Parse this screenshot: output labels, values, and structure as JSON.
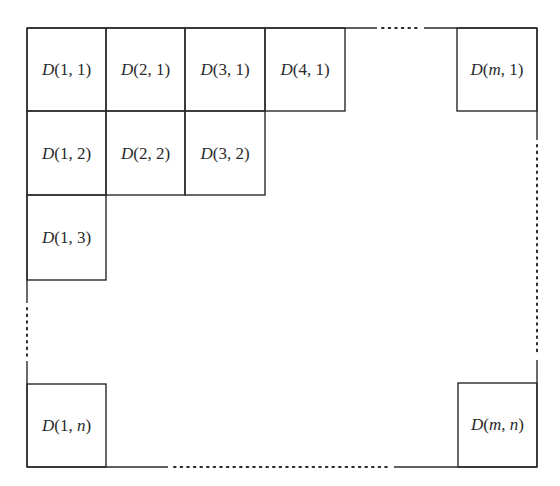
{
  "diagram": {
    "title": "",
    "cells": [
      {
        "id": "D11",
        "prefix": "D",
        "args": "(1, 1)",
        "a": "1",
        "b": "1",
        "col": 1,
        "row": 1
      },
      {
        "id": "D21",
        "prefix": "D",
        "args": "(2, 1)",
        "a": "2",
        "b": "1",
        "col": 2,
        "row": 1
      },
      {
        "id": "D31",
        "prefix": "D",
        "args": "(3, 1)",
        "a": "3",
        "b": "1",
        "col": 3,
        "row": 1
      },
      {
        "id": "D41",
        "prefix": "D",
        "args": "(4, 1)",
        "a": "4",
        "b": "1",
        "col": 4,
        "row": 1
      },
      {
        "id": "Dm1",
        "prefix": "D",
        "args": "(m, 1)",
        "a": "m",
        "b": "1",
        "col": "m",
        "row": 1
      },
      {
        "id": "D12",
        "prefix": "D",
        "args": "(1, 2)",
        "a": "1",
        "b": "2",
        "col": 1,
        "row": 2
      },
      {
        "id": "D22",
        "prefix": "D",
        "args": "(2, 2)",
        "a": "2",
        "b": "2",
        "col": 2,
        "row": 2
      },
      {
        "id": "D32",
        "prefix": "D",
        "args": "(3, 2)",
        "a": "3",
        "b": "2",
        "col": 3,
        "row": 2
      },
      {
        "id": "D13",
        "prefix": "D",
        "args": "(1, 3)",
        "a": "1",
        "b": "3",
        "col": 1,
        "row": 3
      },
      {
        "id": "D1n",
        "prefix": "D",
        "args": "(1, n)",
        "a": "1",
        "b": "n",
        "col": 1,
        "row": "n"
      },
      {
        "id": "Dmn",
        "prefix": "D",
        "args": "(m, n)",
        "a": "m",
        "b": "n",
        "col": "m",
        "row": "n"
      }
    ],
    "labels": {
      "D11": {
        "p": "D",
        "open": "(",
        "a": "1",
        "sep": ", ",
        "b": "1",
        "close": ")"
      },
      "D21": {
        "p": "D",
        "open": "(",
        "a": "2",
        "sep": ", ",
        "b": "1",
        "close": ")"
      },
      "D31": {
        "p": "D",
        "open": "(",
        "a": "3",
        "sep": ", ",
        "b": "1",
        "close": ")"
      },
      "D41": {
        "p": "D",
        "open": "(",
        "a": "4",
        "sep": ", ",
        "b": "1",
        "close": ")"
      },
      "Dm1": {
        "p": "D",
        "open": "(",
        "a": "m",
        "sep": ", ",
        "b": "1",
        "close": ")"
      },
      "D12": {
        "p": "D",
        "open": "(",
        "a": "1",
        "sep": ", ",
        "b": "2",
        "close": ")"
      },
      "D22": {
        "p": "D",
        "open": "(",
        "a": "2",
        "sep": ", ",
        "b": "2",
        "close": ")"
      },
      "D32": {
        "p": "D",
        "open": "(",
        "a": "3",
        "sep": ", ",
        "b": "2",
        "close": ")"
      },
      "D13": {
        "p": "D",
        "open": "(",
        "a": "1",
        "sep": ", ",
        "b": "3",
        "close": ")"
      },
      "D1n": {
        "p": "D",
        "open": "(",
        "a": "1",
        "sep": ", ",
        "b": "n",
        "close": ")"
      },
      "Dmn": {
        "p": "D",
        "open": "(",
        "a": "m",
        "sep": ", ",
        "b": "n",
        "close": ")"
      }
    },
    "ellipsis": {
      "top": "horizontal dotted gap between D(4,1) and D(m,1)",
      "bottom": "horizontal dotted gap between D(1,n) and D(m,n)",
      "left": "vertical dotted gap between D(1,3) and D(1,n)",
      "right": "vertical dotted gap between D(m,1) and D(m,n)"
    },
    "colors": {
      "line": "#2a2a2a",
      "text": "#2a2a2a",
      "background": "#ffffff"
    }
  }
}
